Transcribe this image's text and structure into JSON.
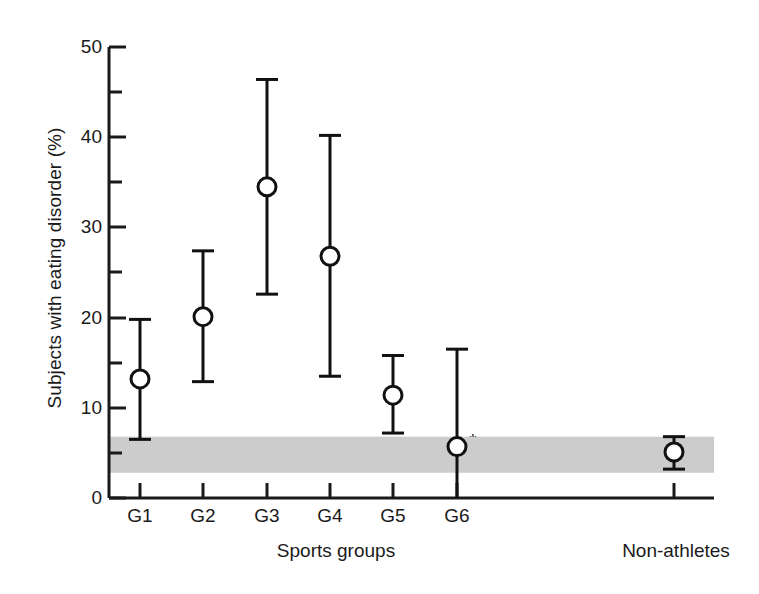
{
  "chart_data": {
    "type": "scatter",
    "title": "",
    "xlabel": "Sports groups",
    "ylabel": "Subjects with eating disorder (%)",
    "ylim": [
      0,
      50
    ],
    "grid": false,
    "legend": "none",
    "yticks_major": [
      0,
      10,
      20,
      30,
      40,
      50
    ],
    "yticks_minor": [
      5,
      15,
      25,
      35,
      45
    ],
    "ytick_labels": [
      "0",
      "10",
      "20",
      "30",
      "40",
      "50"
    ],
    "categories": [
      "G1",
      "G2",
      "G3",
      "G4",
      "G5",
      "G6",
      "Non-athletes"
    ],
    "series": [
      {
        "name": "Subjects with eating disorder (%)",
        "marker": "open-circle",
        "values": [
          13.2,
          20.1,
          34.5,
          26.8,
          11.4,
          5.7,
          5.1
        ],
        "ci_low": [
          6.5,
          12.9,
          22.6,
          13.5,
          7.2,
          0.0,
          3.2
        ],
        "ci_high": [
          19.8,
          27.4,
          46.4,
          40.2,
          15.8,
          16.5,
          6.8
        ]
      }
    ],
    "annotations": [
      {
        "text": "*",
        "attached_to": "G6",
        "meaning": "significance marker"
      }
    ],
    "reference_band": {
      "label": "Non-athlete reference range",
      "low": 2.8,
      "high": 6.8,
      "color": "#cccccc"
    }
  },
  "axis": {
    "x_group_labels": [
      "G1",
      "G2",
      "G3",
      "G4",
      "G5",
      "G6"
    ],
    "x_nonathlete_label": "Non-athletes",
    "x_caption_sports": "Sports groups",
    "y_caption": "Subjects with eating disorder (%)"
  },
  "colors": {
    "axis": "#1a1a1a",
    "marker_stroke": "#111111",
    "marker_fill": "#ffffff",
    "band": "#cccccc",
    "background": "#ffffff"
  },
  "marker": {
    "star_symbol": "*"
  }
}
